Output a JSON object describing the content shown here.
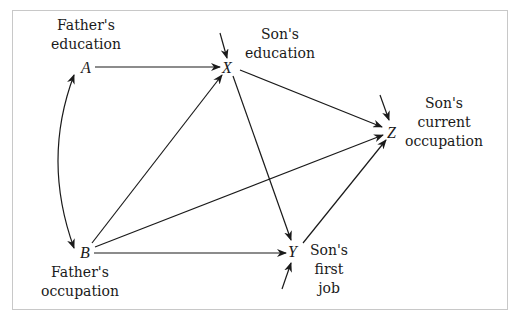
{
  "diagram": {
    "type": "path-diagram",
    "nodes": [
      {
        "id": "A",
        "symbol": "A",
        "label_line1": "Father's",
        "label_line2": "education"
      },
      {
        "id": "B",
        "symbol": "B",
        "label_line1": "Father's",
        "label_line2": "occupation"
      },
      {
        "id": "X",
        "symbol": "X",
        "label_line1": "Son's",
        "label_line2": "education"
      },
      {
        "id": "Y",
        "symbol": "Y",
        "label_line1": "Son's",
        "label_line2": "first",
        "label_line3": "job"
      },
      {
        "id": "Z",
        "symbol": "Z",
        "label_line1": "Son's",
        "label_line2": "current",
        "label_line3": "occupation"
      }
    ],
    "edges": [
      {
        "from": "A",
        "to": "B",
        "type": "bidirectional-curved"
      },
      {
        "from": "A",
        "to": "X",
        "type": "directed"
      },
      {
        "from": "B",
        "to": "X",
        "type": "directed"
      },
      {
        "from": "B",
        "to": "Y",
        "type": "directed"
      },
      {
        "from": "B",
        "to": "Z",
        "type": "directed"
      },
      {
        "from": "X",
        "to": "Y",
        "type": "directed"
      },
      {
        "from": "X",
        "to": "Z",
        "type": "directed"
      },
      {
        "from": "Y",
        "to": "Z",
        "type": "directed"
      }
    ],
    "disturbance_arrows": [
      "X",
      "Y",
      "Z"
    ],
    "colors": {
      "line": "#1a1a1a",
      "frame": "#c8c8c8",
      "background": "#ffffff"
    }
  }
}
